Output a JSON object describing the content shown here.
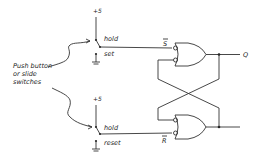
{
  "diagram": {
    "type": "SR latch with NAND-style (OR with inverted inputs) gates and switch inputs",
    "annotation": {
      "line1": "Push button",
      "line2": "or slide",
      "line3": "switches"
    },
    "top_switch": {
      "supply_label": "+5",
      "position_hold": "hold",
      "position_other": "set"
    },
    "bottom_switch": {
      "supply_label": "+5",
      "position_hold": "hold",
      "position_other": "reset"
    },
    "signals": {
      "set_bar": "S",
      "reset_bar": "R",
      "output": "Q"
    },
    "colors": {
      "ink": "#333333",
      "background": "#ffffff"
    }
  }
}
